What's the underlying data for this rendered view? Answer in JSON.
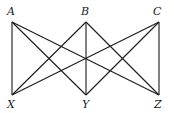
{
  "diagram": {
    "type": "complete-bipartite-graph",
    "name": "K3,3",
    "stroke_color": "#1a1a1a",
    "vertices": [
      {
        "id": "A",
        "label": "A",
        "x": 12,
        "y": 22,
        "lx": 7,
        "ly": 15
      },
      {
        "id": "B",
        "label": "B",
        "x": 86,
        "y": 22,
        "lx": 81,
        "ly": 15
      },
      {
        "id": "C",
        "label": "C",
        "x": 159,
        "y": 22,
        "lx": 153,
        "ly": 15
      },
      {
        "id": "X",
        "label": "X",
        "x": 12,
        "y": 95,
        "lx": 7,
        "ly": 108
      },
      {
        "id": "Y",
        "label": "Y",
        "x": 86,
        "y": 95,
        "lx": 82,
        "ly": 108
      },
      {
        "id": "Z",
        "label": "Z",
        "x": 159,
        "y": 95,
        "lx": 154,
        "ly": 108
      }
    ],
    "edges": [
      {
        "from": "A",
        "to": "X"
      },
      {
        "from": "A",
        "to": "Y"
      },
      {
        "from": "A",
        "to": "Z"
      },
      {
        "from": "B",
        "to": "X"
      },
      {
        "from": "B",
        "to": "Y"
      },
      {
        "from": "B",
        "to": "Z"
      },
      {
        "from": "C",
        "to": "X"
      },
      {
        "from": "C",
        "to": "Y"
      },
      {
        "from": "C",
        "to": "Z"
      }
    ]
  }
}
